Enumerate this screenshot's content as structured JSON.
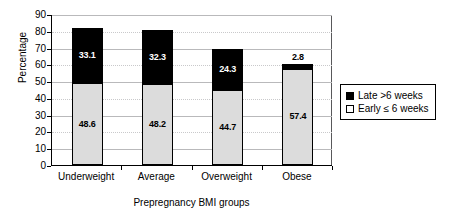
{
  "chart_data": {
    "type": "bar",
    "subtype": "stacked-vertical",
    "title": "",
    "xlabel": "Prepregnancy BMI groups",
    "ylabel": "Percentage",
    "categories": [
      "Underweight",
      "Average",
      "Overweight",
      "Obese"
    ],
    "series": [
      {
        "name": "Early ≤ 6 weeks",
        "color": "#dcdcdc",
        "stack_order": 0,
        "values": [
          48.6,
          48.2,
          44.7,
          57.4
        ],
        "labels": [
          "48.6",
          "48.2",
          "44.7",
          "57.4"
        ],
        "label_position": "inside"
      },
      {
        "name": "Late >6 weeks",
        "color": "#000000",
        "stack_order": 1,
        "values": [
          33.1,
          32.3,
          24.3,
          2.8
        ],
        "labels": [
          "33.1",
          "32.3",
          "24.3",
          "2.8"
        ],
        "label_position": "inside-except-last"
      }
    ],
    "totals": [
      81.7,
      80.5,
      69.0,
      60.2
    ],
    "ylim": [
      0,
      90
    ],
    "ytick_step": 10,
    "yticks": [
      "90",
      "80",
      "70",
      "60",
      "50",
      "40",
      "30",
      "20",
      "10",
      "0"
    ],
    "grid": true,
    "grid_axis": "y",
    "legend_position": "right",
    "legend_entries": [
      "Late >6 weeks",
      "Early ≤ 6 weeks"
    ]
  },
  "legend": {
    "items": [
      {
        "label": "Late >6 weeks",
        "swatch": "black"
      },
      {
        "label": "Early ≤ 6 weeks",
        "swatch": "white"
      }
    ]
  },
  "axes": {
    "y_title": "Percentage",
    "x_title": "Prepregnancy BMI groups"
  }
}
